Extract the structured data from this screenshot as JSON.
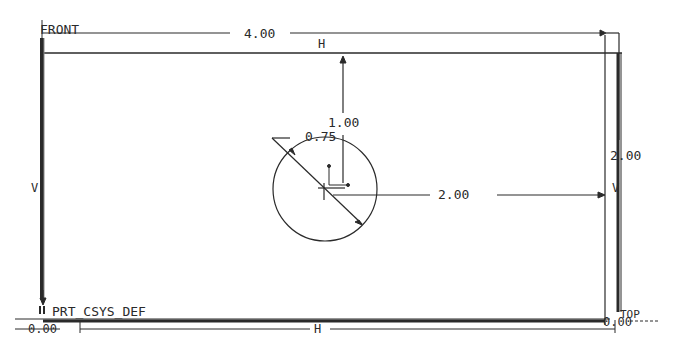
{
  "sketch": {
    "datum_labels": {
      "front": "FRONT",
      "top": "TOP",
      "csys": "PRT_CSYS_DEF"
    },
    "dimensions": {
      "width": "4.00",
      "height": "2.00",
      "hole_offset_top": "1.00",
      "hole_offset_right": "2.00",
      "hole_diameter": "0.75",
      "origin_left": "0.00",
      "origin_right": "0.00"
    },
    "constraints": {
      "top_horizontal": "H",
      "bottom_horizontal": "H",
      "left_vertical": "V",
      "right_vertical": "V"
    },
    "colors": {
      "line": "#2a2a2a",
      "background": "#ffffff"
    }
  }
}
